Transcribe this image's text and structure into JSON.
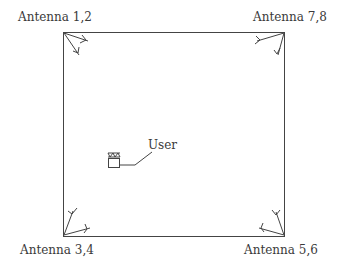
{
  "diagram": {
    "type": "room antenna layout",
    "antennas": [
      {
        "label": "Antenna 1,2",
        "corner": "top-left"
      },
      {
        "label": "Antenna 7,8",
        "corner": "top-right"
      },
      {
        "label": "Antenna 3,4",
        "corner": "bottom-left"
      },
      {
        "label": "Antenna 5,6",
        "corner": "bottom-right"
      }
    ],
    "user": {
      "label": "User"
    },
    "colors": {
      "line": "#444444",
      "background": "#ffffff"
    }
  }
}
